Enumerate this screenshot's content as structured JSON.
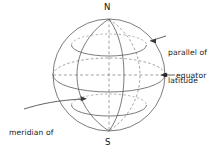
{
  "figure": {
    "type": "globe-graticule-diagram",
    "background_color": "#ffffff",
    "line_color": "#555555",
    "text_color": "#1a1a1a"
  },
  "labels": {
    "north_pole": "N",
    "south_pole": "S",
    "parallel_line1": "parallel of",
    "parallel_line2": "latitude",
    "equator": "equator",
    "meridian_line1": "meridian of",
    "meridian_line2": "longitude"
  },
  "geometry": {
    "center_x": 109,
    "center_y": 75,
    "radius": 56,
    "north_pole_point": [
      109,
      19
    ],
    "south_pole_point": [
      109,
      131
    ],
    "equator_left_point": [
      53,
      75
    ],
    "equator_right_point": [
      165,
      75
    ]
  },
  "elements": {
    "sphere_outline": "circle",
    "polar_axis": "dashed-vertical",
    "equator_style": "dashed-horizontal-with-ellipse",
    "meridians": 3,
    "parallels": 2
  }
}
